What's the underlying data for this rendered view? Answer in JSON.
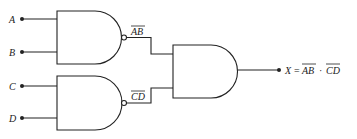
{
  "diagram": {
    "type": "logic-circuit",
    "inputs": [
      {
        "label": "A",
        "gate": "nand-1"
      },
      {
        "label": "B",
        "gate": "nand-1"
      },
      {
        "label": "C",
        "gate": "nand-2"
      },
      {
        "label": "D",
        "gate": "nand-2"
      }
    ],
    "gates": [
      {
        "id": "nand-1",
        "kind": "NAND",
        "inputs": [
          "A",
          "B"
        ],
        "output_label": "AB",
        "output_overbar": true
      },
      {
        "id": "nand-2",
        "kind": "NAND",
        "inputs": [
          "C",
          "D"
        ],
        "output_label": "CD",
        "output_overbar": true
      },
      {
        "id": "and-1",
        "kind": "AND",
        "inputs": [
          "nand-1",
          "nand-2"
        ]
      }
    ],
    "output": {
      "lhs": "X",
      "equals": "=",
      "term1": "AB",
      "dot": "·",
      "term2": "CD",
      "expression_text": "X = AB̅ · CD̅ (overbar on AB and on CD)"
    }
  }
}
